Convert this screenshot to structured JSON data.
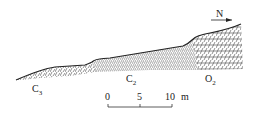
{
  "diagram": {
    "type": "geological-cross-section",
    "north_label": "N",
    "units": [
      {
        "name": "C3",
        "base": "C",
        "sub": "3"
      },
      {
        "name": "C2",
        "base": "C",
        "sub": "2"
      },
      {
        "name": "O2",
        "base": "O",
        "sub": "2"
      }
    ],
    "scale_bar": {
      "ticks": [
        "0",
        "5",
        "10"
      ],
      "unit": "m"
    },
    "colors": {
      "line": "#222222",
      "background": "#ffffff"
    }
  }
}
